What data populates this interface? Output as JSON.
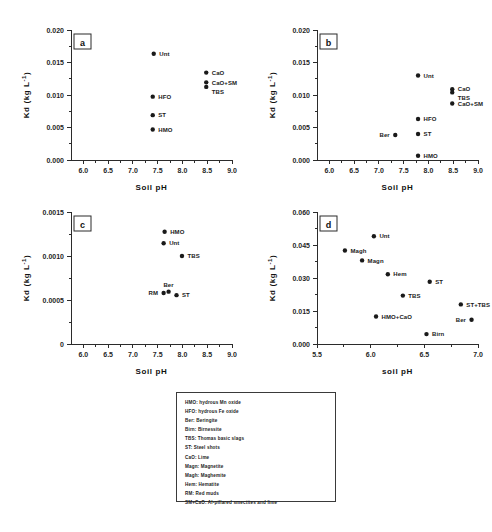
{
  "figure": {
    "background": "#ffffff",
    "ink_color": "#1a1a1a",
    "width": 492,
    "height": 532
  },
  "chart_data": [
    {
      "id": "panel-a",
      "type": "scatter",
      "panel_label": "a",
      "title": "",
      "xlabel": "Soil pH",
      "ylabel": "Kd (kg L⁻¹)",
      "xlim": [
        5.75,
        9.0
      ],
      "ylim": [
        0.0,
        0.02
      ],
      "xticks": [
        "6.0",
        "6.5",
        "7.0",
        "7.5",
        "8.0",
        "8.5",
        "9.0"
      ],
      "xtickvalues": [
        6.0,
        6.5,
        7.0,
        7.5,
        8.0,
        8.5,
        9.0
      ],
      "yticks": [
        "0.000",
        "0.005",
        "0.010",
        "0.015",
        "0.020"
      ],
      "ytickvalues": [
        0.0,
        0.005,
        0.01,
        0.015,
        0.02
      ],
      "grid": false,
      "legend_position": "inline-labels",
      "points": [
        {
          "label": "Unt",
          "x": 7.42,
          "y": 0.01635,
          "label_side": "right"
        },
        {
          "label": "CaO",
          "x": 8.48,
          "y": 0.01345,
          "label_side": "right"
        },
        {
          "label": "CaO+SM",
          "x": 8.48,
          "y": 0.01195,
          "label_side": "right"
        },
        {
          "label": "TBS",
          "x": 8.48,
          "y": 0.01125,
          "label_side": "right-low"
        },
        {
          "label": "HFO",
          "x": 7.4,
          "y": 0.00975,
          "label_side": "right"
        },
        {
          "label": "ST",
          "x": 7.4,
          "y": 0.0069,
          "label_side": "right"
        },
        {
          "label": "HMO",
          "x": 7.4,
          "y": 0.0047,
          "label_side": "right"
        }
      ]
    },
    {
      "id": "panel-b",
      "type": "scatter",
      "panel_label": "b",
      "title": "",
      "xlabel": "Soil pH",
      "ylabel": "Kd (kg L⁻¹)",
      "xlim": [
        5.75,
        9.0
      ],
      "ylim": [
        0.0,
        0.02
      ],
      "xticks": [
        "6.0",
        "6.5",
        "7.0",
        "7.5",
        "8.0",
        "8.5",
        "9.0"
      ],
      "xtickvalues": [
        6.0,
        6.5,
        7.0,
        7.5,
        8.0,
        8.5,
        9.0
      ],
      "yticks": [
        "0.000",
        "0.005",
        "0.010",
        "0.015",
        "0.020"
      ],
      "ytickvalues": [
        0.0,
        0.005,
        0.01,
        0.015,
        0.02
      ],
      "grid": false,
      "legend_position": "inline-labels",
      "points": [
        {
          "label": "Unt",
          "x": 7.79,
          "y": 0.013,
          "label_side": "right"
        },
        {
          "label": "CaO",
          "x": 8.48,
          "y": 0.0109,
          "label_side": "right"
        },
        {
          "label": "TBS",
          "x": 8.48,
          "y": 0.0104,
          "label_side": "right-low"
        },
        {
          "label": "CaO+SM",
          "x": 8.48,
          "y": 0.0087,
          "label_side": "right"
        },
        {
          "label": "HFO",
          "x": 7.79,
          "y": 0.0063,
          "label_side": "right"
        },
        {
          "label": "ST",
          "x": 7.79,
          "y": 0.004,
          "label_side": "right"
        },
        {
          "label": "Ber",
          "x": 7.33,
          "y": 0.00385,
          "label_side": "left"
        },
        {
          "label": "HMO",
          "x": 7.79,
          "y": 0.00065,
          "label_side": "right"
        }
      ]
    },
    {
      "id": "panel-c",
      "type": "scatter",
      "panel_label": "c",
      "title": "",
      "xlabel": "Soil pH",
      "ylabel": "Kd (kg L⁻¹)",
      "xlim": [
        5.75,
        9.0
      ],
      "ylim": [
        0.0,
        0.0015
      ],
      "xticks": [
        "6.0",
        "6.5",
        "7.0",
        "7.5",
        "8.0",
        "8.5",
        "9.0"
      ],
      "xtickvalues": [
        6.0,
        6.5,
        7.0,
        7.5,
        8.0,
        8.5,
        9.0
      ],
      "yticks": [
        "0",
        "0.0005",
        "0.0010",
        "0.0015"
      ],
      "ytickvalues": [
        0.0,
        0.0005,
        0.001,
        0.0015
      ],
      "grid": false,
      "legend_position": "inline-labels",
      "points": [
        {
          "label": "HMO",
          "x": 7.64,
          "y": 0.001275,
          "label_side": "right"
        },
        {
          "label": "Unt",
          "x": 7.62,
          "y": 0.001145,
          "label_side": "right"
        },
        {
          "label": "TBS",
          "x": 7.99,
          "y": 0.001,
          "label_side": "right"
        },
        {
          "label": "Ber",
          "x": 7.72,
          "y": 0.000595,
          "label_side": "above"
        },
        {
          "label": "RM",
          "x": 7.62,
          "y": 0.00058,
          "label_side": "left"
        },
        {
          "label": "ST",
          "x": 7.88,
          "y": 0.000555,
          "label_side": "right"
        }
      ]
    },
    {
      "id": "panel-d",
      "type": "scatter",
      "panel_label": "d",
      "title": "",
      "xlabel": "soil pH",
      "ylabel": "Kd (kg L⁻¹)",
      "xlim": [
        5.5,
        7.0
      ],
      "ylim": [
        0.0,
        0.06
      ],
      "xticks": [
        "5.5",
        "6.0",
        "6.5",
        "7.0"
      ],
      "xtickvalues": [
        5.5,
        6.0,
        6.5,
        7.0
      ],
      "yticks": [
        "0.000",
        "0.015",
        "0.030",
        "0.045",
        "0.060"
      ],
      "ytickvalues": [
        0.0,
        0.015,
        0.03,
        0.045,
        0.06
      ],
      "grid": false,
      "legend_position": "inline-labels",
      "points": [
        {
          "label": "Unt",
          "x": 6.03,
          "y": 0.049,
          "label_side": "right"
        },
        {
          "label": "Magh",
          "x": 5.76,
          "y": 0.0425,
          "label_side": "right"
        },
        {
          "label": "Magn",
          "x": 5.92,
          "y": 0.038,
          "label_side": "right"
        },
        {
          "label": "Hem",
          "x": 6.16,
          "y": 0.0317,
          "label_side": "right"
        },
        {
          "label": "ST",
          "x": 6.55,
          "y": 0.0283,
          "label_side": "right"
        },
        {
          "label": "TBS",
          "x": 6.3,
          "y": 0.022,
          "label_side": "right"
        },
        {
          "label": "ST+TBS",
          "x": 6.84,
          "y": 0.018,
          "label_side": "right"
        },
        {
          "label": "HMO+CaO",
          "x": 6.05,
          "y": 0.0125,
          "label_side": "right"
        },
        {
          "label": "Ber",
          "x": 6.94,
          "y": 0.011,
          "label_side": "left"
        },
        {
          "label": "Birn",
          "x": 6.52,
          "y": 0.0045,
          "label_side": "right"
        }
      ]
    }
  ],
  "legend": {
    "items": [
      "HMO: hydrous Mn oxide",
      "HFO: hydrous Fe oxide",
      "Ber: Beringite",
      "Birn: Birnessite",
      "TBS: Thomas basic slags",
      "ST: Steel shots",
      "CaO: Lime",
      "Magn: Magnetite",
      "Magh: Maghemite",
      "Hem: Hematite",
      "RM: Red muds",
      "SM+CaO: Al-pillared smectites and lime"
    ]
  }
}
